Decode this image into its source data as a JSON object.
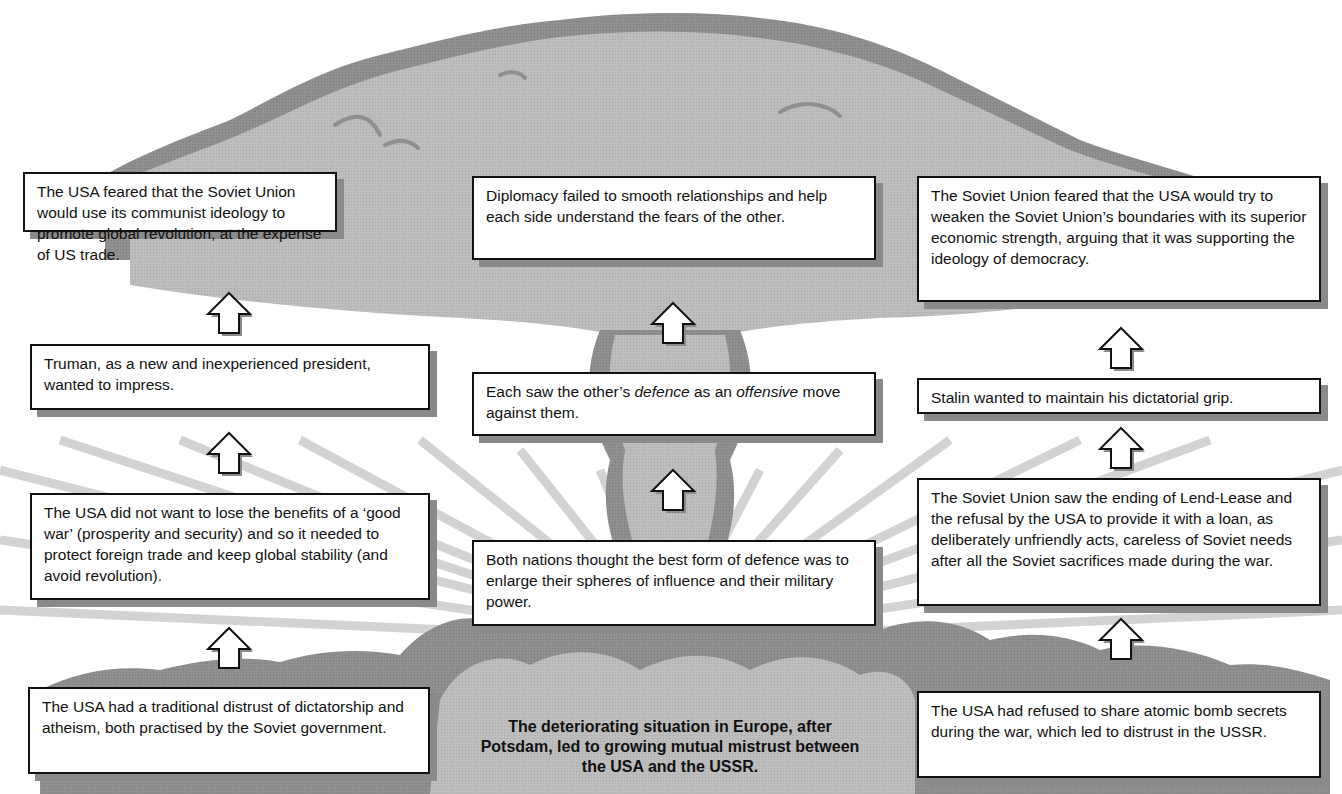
{
  "diagram": {
    "colors": {
      "cloud_light": "#bdbdbd",
      "cloud_dark": "#8e8e8e",
      "box_border": "#111111",
      "shadow": "#8a8a8a",
      "rays": "#c9c9c9"
    },
    "central_statement": "The deteriorating situation in Europe, after Potsdam, led to growing mutual mistrust between the USA and the USSR.",
    "columns": {
      "left": {
        "heading": "USA",
        "boxes": [
          "The USA had a traditional distrust of dictatorship and atheism, both practised by the Soviet government.",
          "The USA did not want to lose the benefits of a ‘good war’ (prosperity and security) and so it needed to protect foreign trade and keep global stability (and avoid revolution).",
          "Truman, as a new and inexperienced president, wanted to impress.",
          "The USA feared that the Soviet Union would use its communist ideology to promote global revolution, at the expense of US trade."
        ]
      },
      "middle": {
        "heading": "Both",
        "boxes": [
          "Both nations thought the best form of defence was to enlarge their spheres of influence and their military power.",
          "Each saw the other’s defence as an offensive move against them.",
          "Diplomacy failed to smooth relationships and help each side understand the fears of the other."
        ],
        "box_1_parts": {
          "prefix": "Each saw the other’s ",
          "italic_1": "defence",
          "middle": " as an ",
          "italic_2": "offensive",
          "suffix": " move against them."
        }
      },
      "right": {
        "heading": "USSR",
        "boxes": [
          "The USA had refused to share atomic bomb secrets during the war, which led to distrust in the USSR.",
          "The Soviet Union saw the ending of Lend-Lease and the refusal by the USA to provide it with a loan, as deliberately unfriendly acts, careless of Soviet needs after all the Soviet sacrifices made during the war.",
          "Stalin wanted to maintain his dictatorial grip.",
          "The Soviet Union feared that the USA would try to weaken the Soviet Union’s boundaries with its superior economic strength, arguing that it was supporting the ideology of democracy."
        ]
      }
    },
    "arrow_icon": "up-arrow-outline"
  }
}
